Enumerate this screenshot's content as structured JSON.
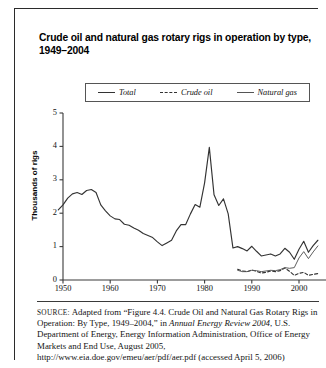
{
  "figure": {
    "title": "Crude oil and natural gas rotary rigs in operation by type, 1949–2004",
    "source_label": "SOURCE:",
    "source_parts": {
      "p1": " Adapted from “Figure 4.4. Crude Oil and Natural Gas Rotary Rigs in Operation: By Type, 1949–2004,” in ",
      "italic1": "Annual Energy Review 2004",
      "p2": ", U.S. Department of Energy, Energy Information Administration, Office of Energy Markets and End Use, August 2005, http://www.eia",
      "p3": ".doe.gov/emeu/aer/pdf/aer.pdf (accessed April 5, 2006)"
    }
  },
  "legend": {
    "position": "top-center",
    "items": [
      {
        "label": "Total",
        "style": "solid",
        "color": "#333333"
      },
      {
        "label": "Crude oil",
        "style": "dashed",
        "color": "#333333"
      },
      {
        "label": "Natural gas",
        "style": "solid-thin",
        "color": "#555555"
      }
    ]
  },
  "axes": {
    "ylabel": "Thousands of rigs",
    "yticks": [
      "0",
      "1",
      "2",
      "3",
      "4",
      "5"
    ],
    "xticks": [
      "1950",
      "1960",
      "1970",
      "1980",
      "1990",
      "2000"
    ]
  },
  "chart_data": {
    "type": "line",
    "title": "Crude oil and natural gas rotary rigs in operation by type, 1949–2004",
    "xlabel": "",
    "ylabel": "Thousands of rigs",
    "xlim": [
      1949,
      2004
    ],
    "ylim": [
      0,
      5
    ],
    "grid": false,
    "legend_position": "top-center",
    "x": [
      1949,
      1950,
      1951,
      1952,
      1953,
      1954,
      1955,
      1956,
      1957,
      1958,
      1959,
      1960,
      1961,
      1962,
      1963,
      1964,
      1965,
      1966,
      1967,
      1968,
      1969,
      1970,
      1971,
      1972,
      1973,
      1974,
      1975,
      1976,
      1977,
      1978,
      1979,
      1980,
      1981,
      1982,
      1983,
      1984,
      1985,
      1986,
      1987,
      1988,
      1989,
      1990,
      1991,
      1992,
      1993,
      1994,
      1995,
      1996,
      1997,
      1998,
      1999,
      2000,
      2001,
      2002,
      2003,
      2004
    ],
    "series": [
      {
        "name": "Total",
        "style": "solid",
        "color": "#333333",
        "values": [
          2.1,
          2.25,
          2.45,
          2.58,
          2.62,
          2.56,
          2.68,
          2.71,
          2.62,
          2.25,
          2.07,
          1.92,
          1.83,
          1.81,
          1.67,
          1.64,
          1.56,
          1.49,
          1.39,
          1.33,
          1.27,
          1.14,
          1.03,
          1.11,
          1.19,
          1.47,
          1.66,
          1.66,
          1.98,
          2.26,
          2.18,
          2.91,
          3.97,
          2.55,
          2.23,
          2.43,
          1.98,
          0.96,
          1.0,
          0.94,
          0.87,
          1.01,
          0.86,
          0.72,
          0.75,
          0.78,
          0.72,
          0.78,
          0.95,
          0.83,
          0.62,
          0.92,
          1.16,
          0.83,
          1.03,
          1.19
        ]
      },
      {
        "name": "Crude oil",
        "style": "dashed",
        "color": "#333333",
        "values": [
          null,
          null,
          null,
          null,
          null,
          null,
          null,
          null,
          null,
          null,
          null,
          null,
          null,
          null,
          null,
          null,
          null,
          null,
          null,
          null,
          null,
          null,
          null,
          null,
          null,
          null,
          null,
          null,
          null,
          null,
          null,
          null,
          null,
          null,
          null,
          null,
          null,
          null,
          0.32,
          0.27,
          0.25,
          0.3,
          0.26,
          0.21,
          0.23,
          0.27,
          0.25,
          0.28,
          0.36,
          0.26,
          0.14,
          0.2,
          0.23,
          0.14,
          0.17,
          0.19
        ]
      },
      {
        "name": "Natural gas",
        "style": "solid-thin",
        "color": "#555555",
        "values": [
          null,
          null,
          null,
          null,
          null,
          null,
          null,
          null,
          null,
          null,
          null,
          null,
          null,
          null,
          null,
          null,
          null,
          null,
          null,
          null,
          null,
          null,
          null,
          null,
          null,
          null,
          null,
          null,
          null,
          null,
          null,
          null,
          null,
          null,
          null,
          null,
          null,
          null,
          0.29,
          0.25,
          0.25,
          0.29,
          0.28,
          0.25,
          0.27,
          0.29,
          0.28,
          0.31,
          0.37,
          0.35,
          0.37,
          0.66,
          0.85,
          0.64,
          0.84,
          1.02
        ]
      }
    ]
  }
}
